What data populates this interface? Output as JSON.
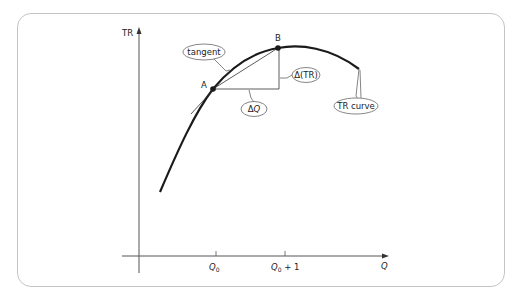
{
  "diagram": {
    "axes": {
      "y_label": "TR",
      "x_label": "Q",
      "x_ticks": [
        {
          "label_main": "Q",
          "label_sub": "0",
          "label_suffix": ""
        },
        {
          "label_main": "Q",
          "label_sub": "0",
          "label_suffix": " + 1"
        }
      ]
    },
    "points": {
      "a": "A",
      "b": "B"
    },
    "callouts": {
      "tangent": "tangent",
      "delta_tr": "Δ(TR)",
      "delta_q_prefix": "Δ",
      "delta_q_var": "Q",
      "tr_curve": "TR curve"
    }
  },
  "colors": {
    "curve": "#1a1a1a",
    "axis": "#555555",
    "frame": "#c4c4c4",
    "callout_stroke": "#666666"
  }
}
